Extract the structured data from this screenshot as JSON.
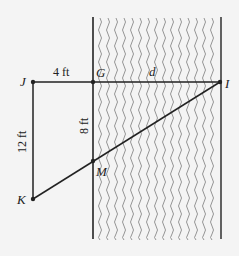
{
  "diagram": {
    "points": {
      "J": {
        "label": "J",
        "x": 33,
        "y": 82
      },
      "G": {
        "label": "G",
        "x": 93,
        "y": 82
      },
      "I": {
        "label": "I",
        "x": 220,
        "y": 82
      },
      "K": {
        "label": "K",
        "x": 33,
        "y": 199
      },
      "M": {
        "label": "M",
        "x": 93,
        "y": 161
      }
    },
    "measurements": {
      "JG": "4 ft",
      "GI": "d",
      "JK": "12 ft",
      "GM": "8 ft"
    },
    "river": {
      "x_left": 93,
      "x_right": 221,
      "y_top": 17,
      "y_bottom": 239
    },
    "colors": {
      "line": "#222222",
      "wave": "#8a8a8a",
      "background": "#f4f4f4"
    }
  }
}
